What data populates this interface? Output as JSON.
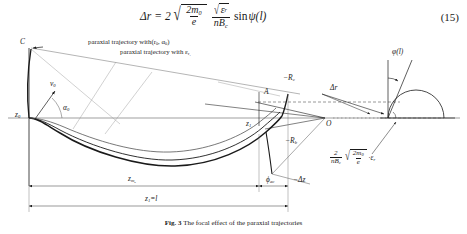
{
  "equation": {
    "lhs": "Δr",
    "equals": "=",
    "coefficient": "2",
    "radical_num": "2m",
    "radical_num_sub": "0",
    "radical_den": "e",
    "frac2_num_eps": "ε",
    "frac2_num_eps_sub": "r",
    "frac2_den": "nB",
    "frac2_den_sub": "c",
    "trig": "sin",
    "psi": "ψ(l)",
    "number": "(15)"
  },
  "figure": {
    "annotations": {
      "paraxial_1": "paraxial trajectory with(r",
      "paraxial_1_sub": "0",
      "paraxial_1_mid": ",  α",
      "paraxial_1_sub2": "0",
      "paraxial_1_end": ")",
      "paraxial_2": "paraxial trajectory with ε",
      "paraxial_2_sub": "r",
      "paraxial_2_sub2": "1"
    },
    "labels": {
      "point_c": "C",
      "v0": "v",
      "v0_sub": "0",
      "alpha0": "α",
      "alpha0_sub": "0",
      "z0": "z",
      "z0_sub": "0",
      "point_a": "A",
      "point_o": "O",
      "z1": "z",
      "z1_sub": "1",
      "neg_Rc": "−R",
      "neg_Rc_sub": "c",
      "neg_Rb": "−R",
      "neg_Rb_sub": "b",
      "phi_ac": "ϕ",
      "phi_ac_sub": "ac",
      "delta_r": "Δr",
      "phi_l": "φ(l)",
      "neg_delta_z": "−Δz",
      "z_m0": "z",
      "z_m0_sub": "m",
      "z_m0_sub2": "0",
      "z1_eq_l": "z",
      "z1_eq_l_sub": "1",
      "z1_eq_l_end": "=l"
    },
    "inset_formula": {
      "frac_num": "2",
      "frac_den": "nB",
      "frac_den_sub": "c",
      "radical_num": "2m",
      "radical_num_sub": "0",
      "radical_den": "e",
      "tail": "·ε",
      "tail_sub": "r"
    }
  },
  "caption": {
    "label": "Fig. 3",
    "text": "The focal effect of the paraxial trajectories"
  },
  "colors": {
    "ink": "#1a1a1a",
    "thin": "#555555",
    "background": "#ffffff"
  }
}
